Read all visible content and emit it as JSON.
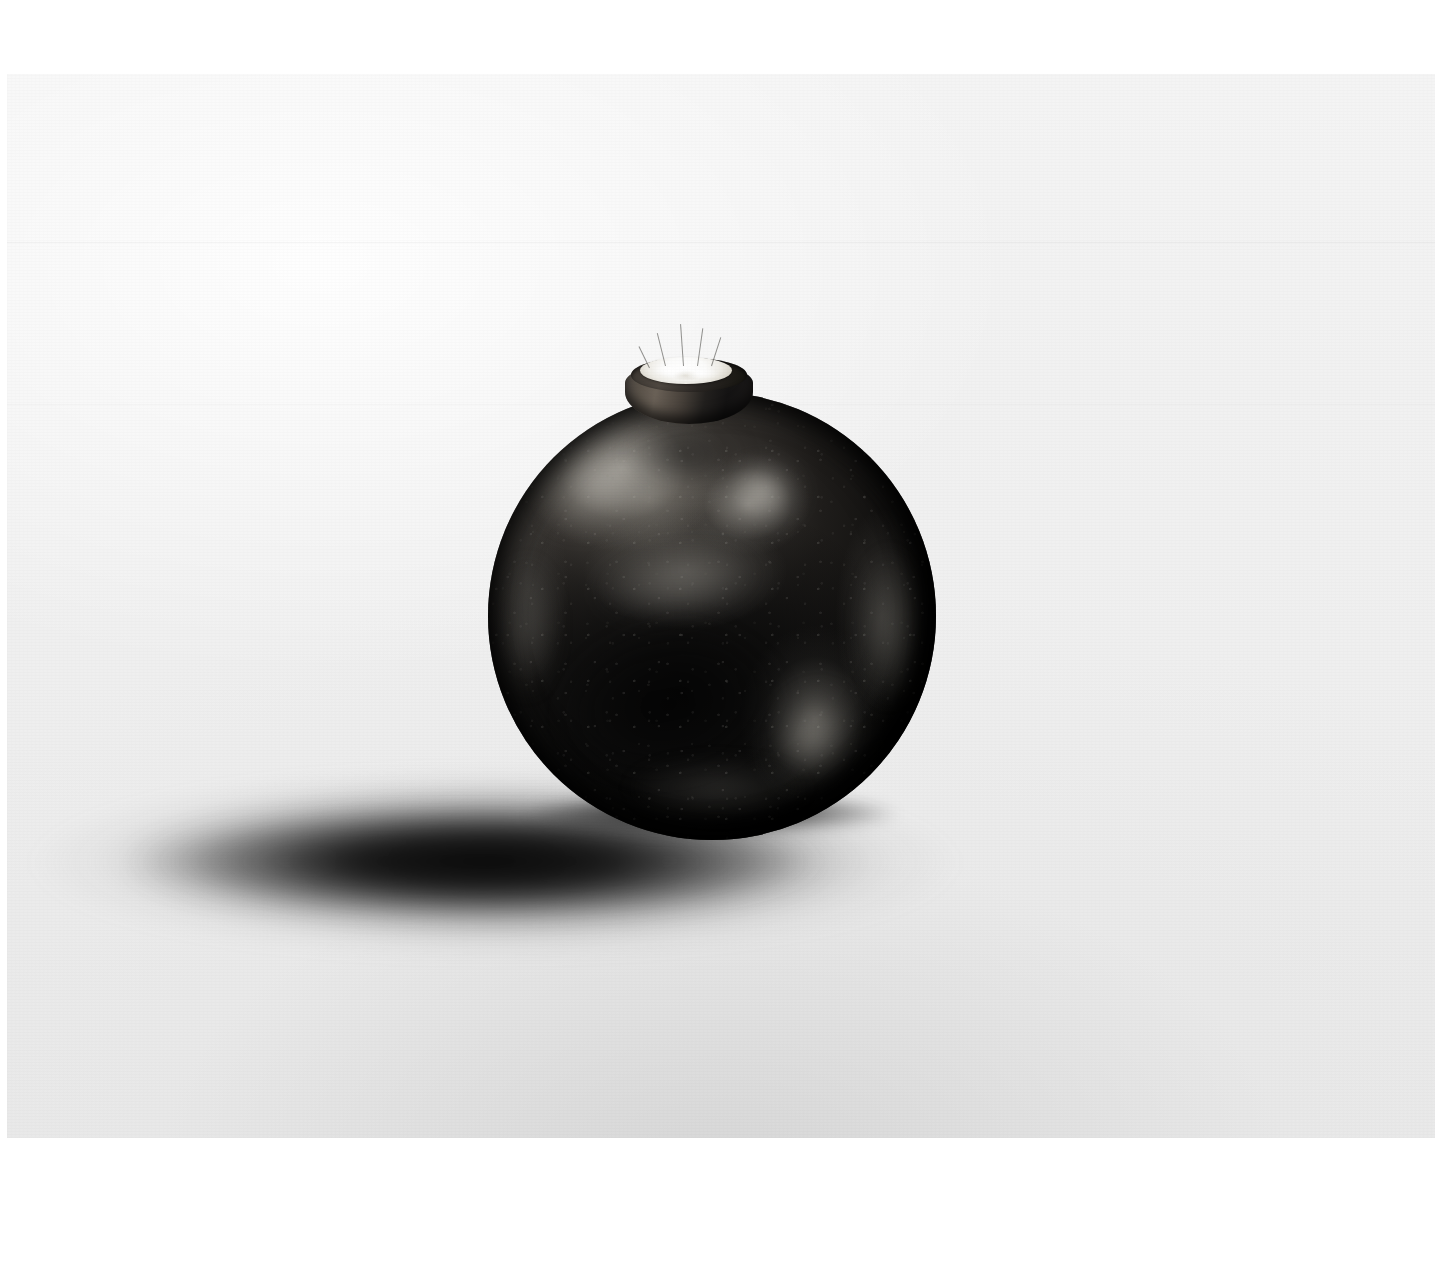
{
  "page": {
    "kind": "photograph-plate",
    "background_color": "#ffffff"
  },
  "photo": {
    "name": "dark-spherical-vessel-photograph",
    "backdrop_color": "#f1f1f1",
    "backdrop_shadow_color": "#1a1a1a",
    "frame": {
      "left": 7,
      "top": 74,
      "width": 1428,
      "height": 1064
    },
    "caption": "",
    "subject": {
      "name": "round dark ceramic vessel",
      "description": "A nearly spherical smoke-fired ceramic pot with a short cylindrical neck, filled with a white powdery substance, resting on a pale seamless backdrop with a soft cast shadow.",
      "body_color": "#141312",
      "highlight_color": "#b2afa8",
      "neck_color": "#4b4641",
      "contents_color": "#ffffff",
      "center_x": 712,
      "center_y": 616,
      "diameter": 448
    }
  },
  "elements": {
    "neck_label": "neck",
    "rim_label": "rim",
    "contents_label": "white contents",
    "body_label": "vessel body",
    "shadow_label": "cast shadow",
    "backdrop_label": "backdrop"
  }
}
